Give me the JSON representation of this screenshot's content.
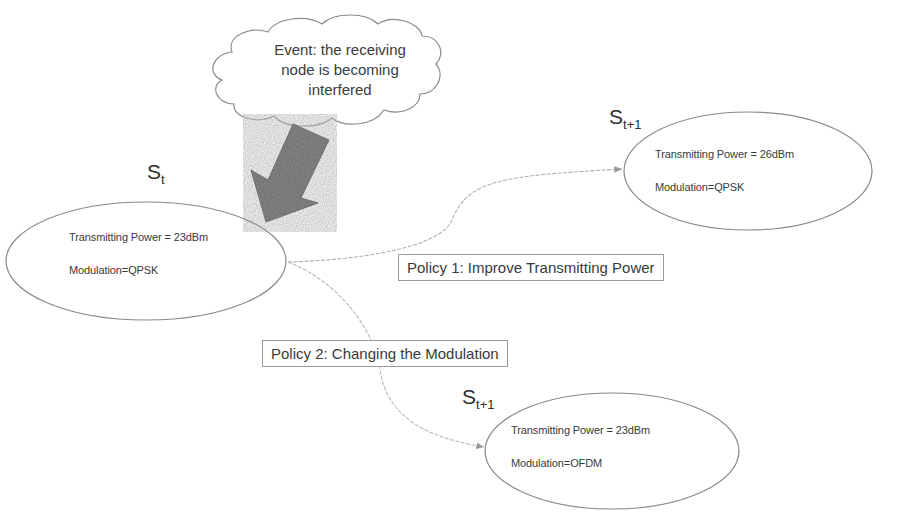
{
  "event_cloud": {
    "line1": "Event: the receiving",
    "line2": "node is becoming",
    "line3": "interfered"
  },
  "states": {
    "current": {
      "label_main": "S",
      "label_sub": "t",
      "power": "Transmitting Power = 23dBm",
      "modulation": "Modulation=QPSK"
    },
    "next_policy1": {
      "label_main": "S",
      "label_sub": "t+1",
      "power": "Transmitting Power = 26dBm",
      "modulation": "Modulation=QPSK"
    },
    "next_policy2": {
      "label_main": "S",
      "label_sub": "t+1",
      "power": "Transmitting Power = 23dBm",
      "modulation": "Modulation=OFDM"
    }
  },
  "policies": {
    "policy1": "Policy 1: Improve Transmitting Power",
    "policy2": "Policy 2: Changing the Modulation"
  },
  "colors": {
    "event_arrow": "#8c8c8c",
    "outline": "#8a8a8a",
    "connector": "#b0b0b0"
  }
}
